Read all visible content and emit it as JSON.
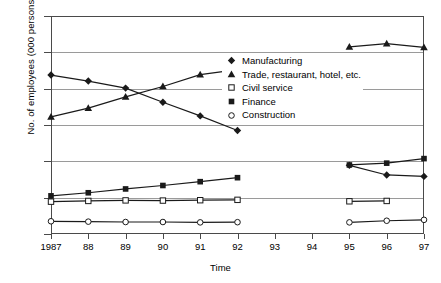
{
  "chart_data": {
    "type": "line",
    "title": "",
    "xlabel": "Time",
    "ylabel": "No. of employees (000 persons)",
    "categories": [
      "1987",
      "88",
      "89",
      "90",
      "91",
      "92",
      "93",
      "94",
      "95",
      "96",
      "97"
    ],
    "x": [
      1987,
      1988,
      1989,
      1990,
      1991,
      1992,
      1993,
      1994,
      1995,
      1996,
      1997
    ],
    "ylim": [
      0,
      1200
    ],
    "yticks": [
      0,
      200,
      400,
      600,
      800,
      1000,
      1200
    ],
    "grid": true,
    "legend_position": "inside-upper-right",
    "series": [
      {
        "name": "Manufacturing",
        "marker": "filled-diamond",
        "x": [
          1987,
          1988,
          1989,
          1990,
          1991,
          1992,
          1995,
          1996,
          1997
        ],
        "values": [
          875,
          842,
          803,
          725,
          650,
          570,
          378,
          325,
          317
        ]
      },
      {
        "name": "Trade, restaurant, hotel, etc.",
        "marker": "filled-triangle",
        "x": [
          1987,
          1988,
          1989,
          1990,
          1991,
          1992,
          1995,
          1996,
          1997
        ],
        "values": [
          645,
          693,
          755,
          812,
          877,
          905,
          1030,
          1048,
          1027
        ]
      },
      {
        "name": "Civil service",
        "marker": "open-square",
        "x": [
          1987,
          1988,
          1989,
          1990,
          1991,
          1992,
          1995,
          1996
        ],
        "values": [
          178,
          182,
          185,
          184,
          186,
          188,
          180,
          182
        ]
      },
      {
        "name": "Finance",
        "marker": "filled-square",
        "x": [
          1987,
          1988,
          1989,
          1990,
          1991,
          1992,
          1995,
          1996,
          1997
        ],
        "values": [
          210,
          227,
          248,
          267,
          288,
          310,
          380,
          390,
          415
        ]
      },
      {
        "name": "Construction",
        "marker": "open-circle",
        "x": [
          1987,
          1988,
          1989,
          1990,
          1991,
          1992,
          1995,
          1996,
          1997
        ],
        "values": [
          70,
          68,
          66,
          66,
          64,
          65,
          64,
          73,
          78
        ]
      }
    ]
  },
  "axis": {
    "y_tick_labels": [
      "1200",
      "1000",
      "800",
      "600",
      "400",
      "200",
      "0"
    ],
    "x_tick_labels": [
      "1987",
      "88",
      "89",
      "90",
      "91",
      "92",
      "93",
      "94",
      "95",
      "96",
      "97"
    ]
  },
  "legend": {
    "items": [
      {
        "label": "Manufacturing",
        "marker": "filled-diamond"
      },
      {
        "label": "Trade, restaurant, hotel, etc.",
        "marker": "filled-triangle"
      },
      {
        "label": "Civil service",
        "marker": "open-square"
      },
      {
        "label": "Finance",
        "marker": "filled-square"
      },
      {
        "label": "Construction",
        "marker": "open-circle"
      }
    ]
  },
  "style": {
    "line_color": "#1a1a1a",
    "grid_color": "#9a9a9a",
    "frame_color": "#4a4a4a",
    "background": "#ffffff"
  }
}
